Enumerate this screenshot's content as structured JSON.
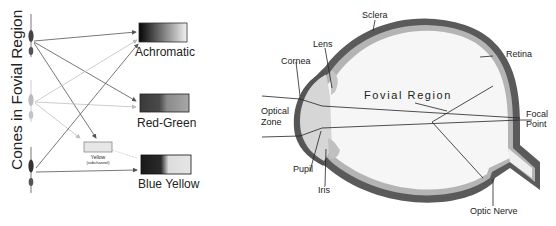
{
  "left_panel": {
    "vertical_title": "Cones in Fovial Region",
    "channels": [
      {
        "label": "Achromatic"
      },
      {
        "label": "Red-Green"
      },
      {
        "label": "Blue Yellow"
      }
    ],
    "subchannel": {
      "label": "Yellow",
      "sublabel": "(subchannel)"
    }
  },
  "right_panel": {
    "labels": {
      "sclera": "Sclera",
      "lens": "Lens",
      "cornea": "Cornea",
      "retina": "Retina",
      "optical_zone_1": "Optical",
      "optical_zone_2": "Zone",
      "fovial_region": "Fovial Region",
      "focal_point_1": "Focal",
      "focal_point_2": "Point",
      "pupil": "Pupil",
      "iris": "Iris",
      "optic_nerve": "Optic Nerve"
    }
  },
  "colors": {
    "sclera": "#5a5a5a",
    "retina": "#b0b0b0",
    "cornea_fill": "#d4d4d4",
    "eye_interior": "#f6f6f6",
    "line": "#222222"
  }
}
